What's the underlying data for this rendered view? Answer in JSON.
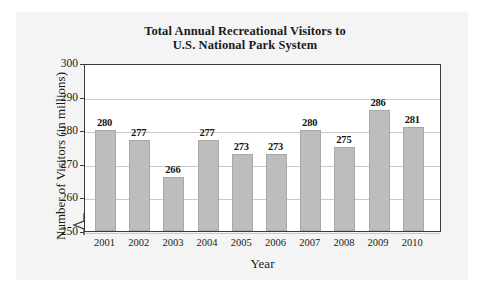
{
  "chart_data": {
    "type": "bar",
    "title": "Total Annual Recreational Visitors to U.S. National Park System",
    "title_line1": "Total Annual Recreational Visitors to",
    "title_line2": "U.S. National Park System",
    "xlabel": "Year",
    "ylabel": "Number of Visitors (in millions)",
    "categories": [
      "2001",
      "2002",
      "2003",
      "2004",
      "2005",
      "2006",
      "2007",
      "2008",
      "2009",
      "2010"
    ],
    "values": [
      280,
      277,
      266,
      277,
      273,
      273,
      280,
      275,
      286,
      281
    ],
    "ylim": [
      250,
      300
    ],
    "yticks": [
      "250",
      "260",
      "270",
      "280",
      "290",
      "300"
    ],
    "ytick_values": [
      250,
      260,
      270,
      280,
      290,
      300
    ],
    "grid": "horizontal",
    "legend": "none",
    "axis_break": "y-axis broken below 250",
    "bar_color": "#bdbdbd",
    "bar_edge_color": "#a8a8a8",
    "gridline_color": "#c9c9c9",
    "frame_color": "#3a3a3a",
    "text_color": "#1a1a1a",
    "panel_color": "#f4f4f4"
  }
}
